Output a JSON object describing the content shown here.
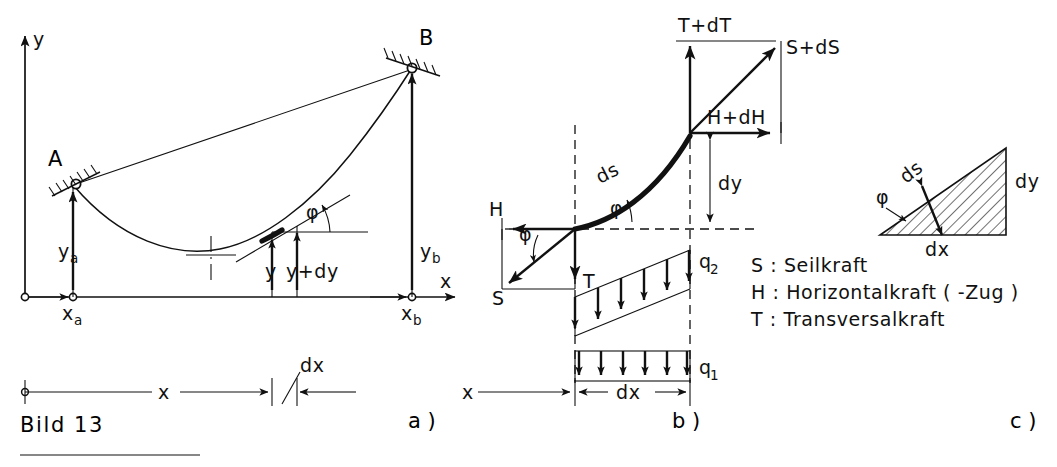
{
  "figure": {
    "caption": "Bild 13",
    "top_cut_text": "",
    "panels": [
      {
        "id": "a",
        "label": "a )"
      },
      {
        "id": "b",
        "label": "b )"
      },
      {
        "id": "c",
        "label": "c )"
      }
    ]
  },
  "panel_a": {
    "name": "cable-sag-geometry",
    "axis_y_label": "y",
    "axis_x_label": "x",
    "support_a_label": "A",
    "support_b_label": "B",
    "ya_label": "y",
    "ya_sub": "a",
    "yb_label": "y",
    "yb_sub": "b",
    "xa_label": "x",
    "xa_sub": "a",
    "xb_label": "x",
    "xb_sub": "b",
    "y_label": "y",
    "ydy_label": "y+dy",
    "x_dim_label": "x",
    "dx_dim_label": "dx",
    "phi_label": "φ"
  },
  "panel_b": {
    "name": "cable-element-forces",
    "ds_label": "ds",
    "dy_label": "dy",
    "dx_label": "dx",
    "x_label": "x",
    "phi_label": "φ",
    "phi_label_2": "φ",
    "force_h": "H",
    "force_t": "T",
    "force_s": "S",
    "force_t_dt": "T+dT",
    "force_h_dh": "H+dH",
    "force_s_ds": "S+dS",
    "load_q2": "q",
    "load_q2_sub": "2",
    "load_q1": "q",
    "load_q1_sub": "1"
  },
  "panel_c": {
    "name": "differential-triangle",
    "ds_label": "ds",
    "dy_label": "dy",
    "dx_label": "dx",
    "phi_label": "φ"
  },
  "legend": {
    "name": "symbol-legend",
    "entries": [
      "S : Seilkraft",
      "H : Horizontalkraft ( -Zug )",
      "T : Transversalkraft"
    ]
  },
  "colors": {
    "ink": "#111111",
    "paper": "#ffffff"
  }
}
